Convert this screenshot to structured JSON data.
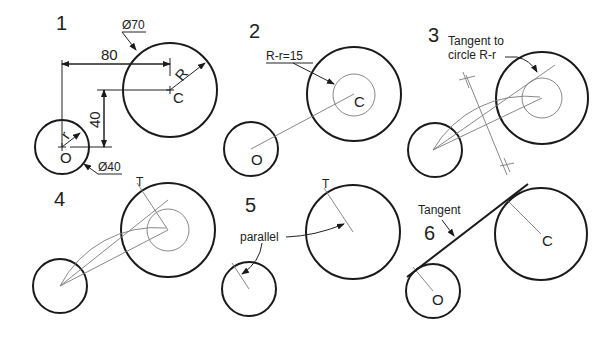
{
  "colors": {
    "ink": "#1a1a1a",
    "construction": "#7a7a7a",
    "background": "#ffffff"
  },
  "panels": [
    {
      "step": "1",
      "labels": {
        "small_center": "O",
        "large_center": "C",
        "small_radius": "r",
        "large_radius": "R"
      },
      "dimensions": {
        "large_diameter": "Ø70",
        "small_diameter": "Ø40",
        "horizontal": "80",
        "vertical": "40"
      }
    },
    {
      "step": "2",
      "labels": {
        "small_center": "O",
        "large_center": "C"
      },
      "note": "R-r=15"
    },
    {
      "step": "3",
      "note_line1": "Tangent to",
      "note_line2": "circle R-r"
    },
    {
      "step": "4",
      "labels": {
        "tangent_point": "T"
      }
    },
    {
      "step": "5",
      "labels": {
        "tangent_point": "T"
      },
      "note": "parallel"
    },
    {
      "step": "6",
      "labels": {
        "small_center": "O",
        "large_center": "C"
      },
      "note": "Tangent"
    }
  ]
}
